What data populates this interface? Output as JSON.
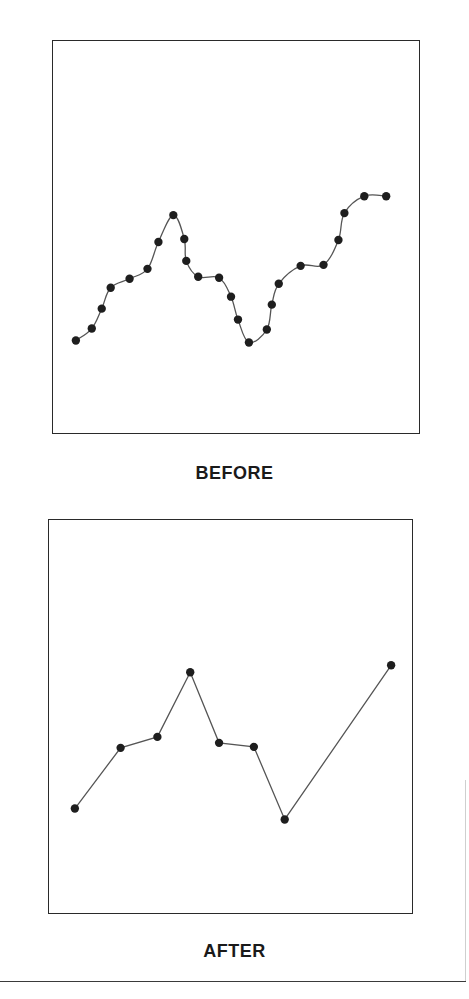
{
  "chart_data": [
    {
      "type": "line",
      "title": "BEFORE",
      "xlabel": "",
      "ylabel": "",
      "grid": false,
      "legend": null,
      "smooth": true,
      "markers": true,
      "frame": {
        "left": 52,
        "top": 40,
        "width": 368,
        "height": 394
      },
      "note": "No axes or tick labels; values are positions within the frame (x from left, y from bottom, in px).",
      "x": [
        23,
        39,
        49,
        58,
        77,
        95,
        106,
        121,
        132,
        134,
        146,
        167,
        179,
        186,
        197,
        215,
        220,
        227,
        249,
        272,
        287,
        293,
        313,
        335
      ],
      "values": [
        93,
        105,
        125,
        146,
        155,
        165,
        192,
        219,
        195,
        173,
        157,
        156,
        137,
        114,
        91,
        104,
        129,
        150,
        168,
        169,
        194,
        221,
        238,
        238
      ]
    },
    {
      "type": "line",
      "title": "AFTER",
      "xlabel": "",
      "ylabel": "",
      "grid": false,
      "legend": null,
      "smooth": false,
      "markers": true,
      "frame": {
        "left": 48,
        "top": 519,
        "width": 365,
        "height": 395
      },
      "note": "No axes or tick labels; values are positions within the frame (x from left, y from bottom, in px).",
      "x": [
        26,
        72,
        109,
        142,
        171,
        206,
        237,
        344
      ],
      "values": [
        105,
        166,
        177,
        242,
        171,
        167,
        94,
        249
      ]
    }
  ],
  "captions": {
    "before": "BEFORE",
    "after": "AFTER"
  },
  "colors": {
    "frame": "#2a2a2a",
    "line": "#555555",
    "marker": "#1e1e1e",
    "text": "#1a1a1a",
    "background": "#ffffff"
  }
}
